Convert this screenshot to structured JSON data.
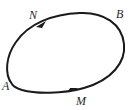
{
  "diagram": {
    "type": "closed-orbit",
    "curve_color": "#1a1a1a",
    "labels": {
      "N": "N",
      "B": "B",
      "A": "A",
      "M": "M"
    },
    "arrows": [
      {
        "near": "N",
        "direction": "clockwise"
      },
      {
        "near": "M",
        "direction": "clockwise"
      }
    ]
  }
}
